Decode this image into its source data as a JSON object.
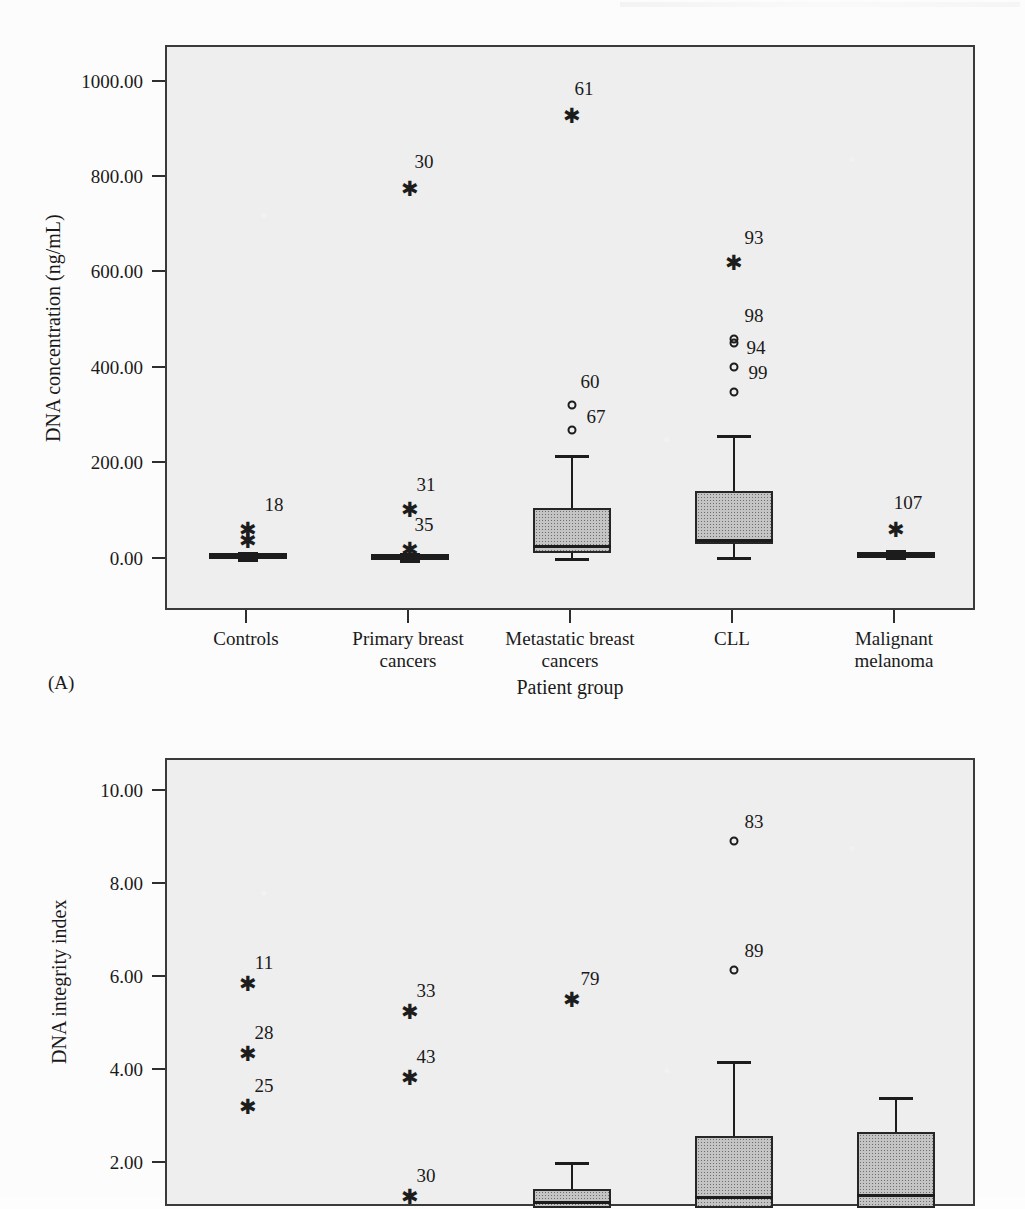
{
  "page": {
    "corner_mark": "",
    "panel_a_tag": "(A)"
  },
  "chart_data": [
    {
      "id": "A",
      "type": "box",
      "title": "",
      "panel_label": "(A)",
      "xlabel": "Patient group",
      "ylabel": "DNA concentration (ng/mL)",
      "ylim": [
        -110,
        1075
      ],
      "yticks": [
        0,
        200,
        400,
        600,
        800,
        1000
      ],
      "ytick_labels": [
        "0.00",
        "200.00",
        "400.00",
        "600.00",
        "800.00",
        "1000.00"
      ],
      "grid": false,
      "legend": "none",
      "categories": [
        "Controls",
        "Primary breast\ncancers",
        "Metastatic breast\ncancers",
        "CLL",
        "Malignant\nmelanoma"
      ],
      "boxes": [
        {
          "category": "Controls",
          "q1": 2,
          "median": 6,
          "q3": 11,
          "whisker_low": 0,
          "whisker_high": 16,
          "flat": true
        },
        {
          "category": "Primary breast cancers",
          "q1": 1,
          "median": 4,
          "q3": 8,
          "whisker_low": 0,
          "whisker_high": 11,
          "flat": true
        },
        {
          "category": "Metastatic breast cancers",
          "q1": 14,
          "median": 30,
          "q3": 108,
          "whisker_low": 3,
          "whisker_high": 219,
          "flat": false
        },
        {
          "category": "CLL",
          "q1": 32,
          "median": 43,
          "q3": 143,
          "whisker_low": 5,
          "whisker_high": 261,
          "flat": false
        },
        {
          "category": "Malignant melanoma",
          "q1": 4,
          "median": 10,
          "q3": 16,
          "whisker_low": 2,
          "whisker_high": 20,
          "flat": true
        }
      ],
      "outliers": [
        {
          "category": "Controls",
          "label": "18",
          "value": 62,
          "marker": "star",
          "label_dx": 26,
          "label_dy": -26
        },
        {
          "category": "Controls",
          "label": "",
          "value": 38,
          "marker": "star",
          "label_dx": 0,
          "label_dy": 0
        },
        {
          "category": "Primary breast cancers",
          "label": "30",
          "value": 777,
          "marker": "star",
          "label_dx": 14,
          "label_dy": -28
        },
        {
          "category": "Primary breast cancers",
          "label": "31",
          "value": 104,
          "marker": "star",
          "label_dx": 16,
          "label_dy": -26
        },
        {
          "category": "Primary breast cancers",
          "label": "35",
          "value": 20,
          "marker": "star",
          "label_dx": 14,
          "label_dy": -26
        },
        {
          "category": "Metastatic breast cancers",
          "label": "61",
          "value": 931,
          "marker": "star",
          "label_dx": 12,
          "label_dy": -28
        },
        {
          "category": "Metastatic breast cancers",
          "label": "60",
          "value": 324,
          "marker": "circle",
          "label_dx": 18,
          "label_dy": -24
        },
        {
          "category": "Metastatic breast cancers",
          "label": "67",
          "value": 272,
          "marker": "circle",
          "label_dx": 24,
          "label_dy": -14
        },
        {
          "category": "CLL",
          "label": "93",
          "value": 622,
          "marker": "star",
          "label_dx": 20,
          "label_dy": -26
        },
        {
          "category": "CLL",
          "label": "98",
          "value": 462,
          "marker": "circle",
          "label_dx": 20,
          "label_dy": -24
        },
        {
          "category": "CLL",
          "label": "",
          "value": 455,
          "marker": "circle",
          "label_dx": 0,
          "label_dy": 0
        },
        {
          "category": "CLL",
          "label": "94",
          "value": 403,
          "marker": "circle",
          "label_dx": 22,
          "label_dy": -20
        },
        {
          "category": "CLL",
          "label": "99",
          "value": 352,
          "marker": "circle",
          "label_dx": 24,
          "label_dy": -20
        },
        {
          "category": "Malignant melanoma",
          "label": "107",
          "value": 63,
          "marker": "star",
          "label_dx": 12,
          "label_dy": -28
        }
      ]
    },
    {
      "id": "B",
      "type": "box",
      "title": "",
      "panel_label": "",
      "xlabel": "",
      "ylabel": "DNA integrity index",
      "ylim": [
        1.05,
        10.7
      ],
      "yticks": [
        2,
        4,
        6,
        8,
        10
      ],
      "ytick_labels": [
        "2.00",
        "4.00",
        "6.00",
        "8.00",
        "10.00"
      ],
      "grid": false,
      "legend": "none",
      "categories": [
        "Controls",
        "Primary breast\ncancers",
        "Metastatic breast\ncancers",
        "CLL",
        "Malignant\nmelanoma"
      ],
      "boxes": [
        {
          "category": "Metastatic breast cancers",
          "q1": 1.05,
          "median": 1.2,
          "q3": 1.45,
          "whisker_low": 1.05,
          "whisker_high": 2.05,
          "flat": false
        },
        {
          "category": "CLL",
          "q1": 1.05,
          "median": 1.3,
          "q3": 2.6,
          "whisker_low": 1.05,
          "whisker_high": 4.22,
          "flat": false
        },
        {
          "category": "Malignant melanoma",
          "q1": 1.05,
          "median": 1.35,
          "q3": 2.68,
          "whisker_low": 1.05,
          "whisker_high": 3.45,
          "flat": false
        }
      ],
      "outliers": [
        {
          "category": "Controls",
          "label": "11",
          "value": 5.88,
          "marker": "star",
          "label_dx": 16,
          "label_dy": -22
        },
        {
          "category": "Controls",
          "label": "28",
          "value": 4.36,
          "marker": "star",
          "label_dx": 16,
          "label_dy": -22
        },
        {
          "category": "Controls",
          "label": "25",
          "value": 3.22,
          "marker": "star",
          "label_dx": 16,
          "label_dy": -22
        },
        {
          "category": "Primary breast cancers",
          "label": "33",
          "value": 5.28,
          "marker": "star",
          "label_dx": 16,
          "label_dy": -22
        },
        {
          "category": "Primary breast cancers",
          "label": "43",
          "value": 3.86,
          "marker": "star",
          "label_dx": 16,
          "label_dy": -22
        },
        {
          "category": "Primary breast cancers",
          "label": "30",
          "value": 1.28,
          "marker": "star",
          "label_dx": 16,
          "label_dy": -22
        },
        {
          "category": "Metastatic breast cancers",
          "label": "79",
          "value": 5.52,
          "marker": "star",
          "label_dx": 18,
          "label_dy": -22
        },
        {
          "category": "CLL",
          "label": "83",
          "value": 8.95,
          "marker": "circle",
          "label_dx": 20,
          "label_dy": -20
        },
        {
          "category": "CLL",
          "label": "89",
          "value": 6.18,
          "marker": "circle",
          "label_dx": 20,
          "label_dy": -20
        }
      ]
    }
  ]
}
